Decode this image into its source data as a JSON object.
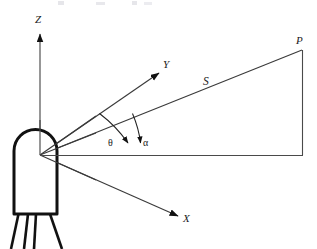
{
  "figure": {
    "kind": "3d-coordinate-geometry-diagram",
    "background_color": "#ffffff",
    "stroke_color": "#2b2b2b",
    "device_outline_color": "#111111",
    "canvas": {
      "width": 317,
      "height": 249
    }
  },
  "axes": {
    "z": {
      "label": "Z",
      "direction": "up",
      "arrow": true
    },
    "y": {
      "label": "Y",
      "direction": "up-right",
      "arrow": true
    },
    "x": {
      "label": "X",
      "direction": "down-right",
      "arrow": true
    }
  },
  "vectors": {
    "range": {
      "label": "S",
      "from": "origin",
      "to": "P"
    }
  },
  "points": {
    "target": {
      "label": "P"
    },
    "origin": {
      "label": ""
    }
  },
  "angles": {
    "theta": {
      "label": "θ",
      "between": "Y-axis and S"
    },
    "alpha": {
      "label": "α",
      "between": "S and horizontal baseline"
    }
  },
  "device": {
    "name": "sensor-package",
    "leg_count": 4
  },
  "top_artifact": {
    "text": ""
  }
}
